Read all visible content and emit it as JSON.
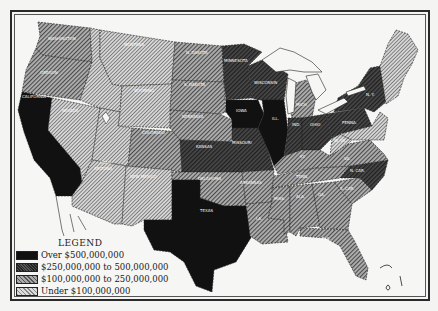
{
  "legend": {
    "title": "LEGEND",
    "items": [
      {
        "label": "Over $500,000,000",
        "category": "over-500m"
      },
      {
        "label": "$250,000,000 to 500,000,000",
        "category": "250m-500m"
      },
      {
        "label": "$100,000,000 to 250,000,000",
        "category": "100m-250m"
      },
      {
        "label": "Under $100,000,000",
        "category": "under-100m"
      }
    ]
  },
  "colors": {
    "over-500m": "#111111",
    "250m-500m": "#3a3a3a",
    "100m-250m": "#808080",
    "under-100m": "#b8b8b8",
    "water": "#f6f6f4",
    "border": "#2a2a2a"
  },
  "states": {
    "over-500m": [
      "California",
      "Texas",
      "Iowa",
      "Illinois"
    ],
    "250m-500m": [
      "Minnesota",
      "Wisconsin",
      "Missouri",
      "Kansas",
      "Indiana",
      "Ohio",
      "Pennsylvania",
      "New York",
      "North Carolina"
    ],
    "100m-250m": [
      "Washington",
      "Oregon",
      "North Dakota",
      "South Dakota",
      "Nebraska",
      "Colorado",
      "Oklahoma",
      "Arkansas",
      "Louisiana",
      "Mississippi",
      "Alabama",
      "Georgia",
      "Florida",
      "Tennessee",
      "Kentucky",
      "Virginia",
      "South Carolina",
      "Michigan"
    ],
    "under-100m": [
      "Montana",
      "Idaho",
      "Wyoming",
      "Nevada",
      "Utah",
      "Arizona",
      "New Mexico",
      "West Virginia",
      "Maine",
      "New Hampshire",
      "Vermont",
      "Massachusetts",
      "Connecticut",
      "Rhode Island",
      "New Jersey",
      "Delaware",
      "Maryland"
    ]
  },
  "labels": {
    "washington": "WASHINGTON",
    "oregon": "OREGON",
    "california": "CALIFORNIA",
    "nevada": "NEVADA",
    "idaho": "IDAHO",
    "montana": "MONTANA",
    "wyoming": "WYOMING",
    "utah": "UTAH",
    "arizona": "ARIZONA",
    "colorado": "COLORADO",
    "new_mexico": "NEW MEXICO",
    "north_dakota": "N. DAKOTA",
    "south_dakota": "S. DAKOTA",
    "nebraska": "NEBRASKA",
    "kansas": "KANSAS",
    "oklahoma": "OKLAHOMA",
    "texas": "TEXAS",
    "minnesota": "MINNESOTA",
    "iowa": "IOWA",
    "missouri": "MISSOURI",
    "arkansas": "ARKANSAS",
    "louisiana": "LA.",
    "wisconsin": "WISCONSIN",
    "illinois": "ILL.",
    "michigan": "MICH.",
    "indiana": "IND.",
    "ohio": "OHIO",
    "kentucky": "KY.",
    "tennessee": "TENN.",
    "mississippi": "MISS.",
    "alabama": "ALA.",
    "georgia": "GA.",
    "florida": "FLA.",
    "south_carolina": "S. CAR.",
    "north_carolina": "N. CAR.",
    "virginia": "VA.",
    "west_virginia": "W. VA.",
    "pennsylvania": "PENNA.",
    "new_york": "N. Y."
  }
}
